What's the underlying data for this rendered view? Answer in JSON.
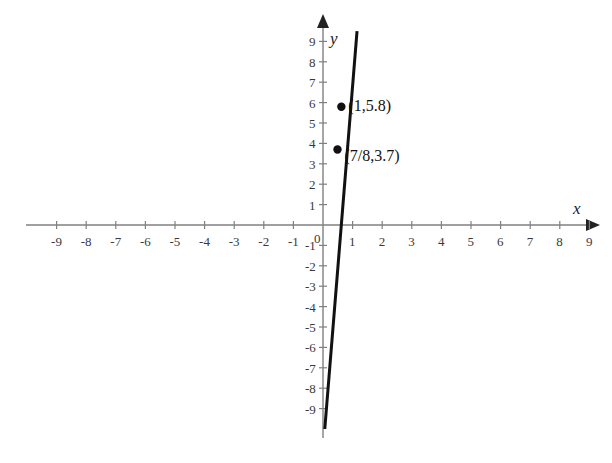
{
  "chart_data": {
    "type": "line",
    "title": "",
    "xlabel": "x",
    "ylabel": "y",
    "xlim": [
      -9.8,
      9.8
    ],
    "ylim": [
      -10.1,
      9.9
    ],
    "grid": false,
    "legend": null,
    "x_ticks": [
      -9,
      -8,
      -7,
      -6,
      -5,
      -4,
      -3,
      -2,
      -1,
      0,
      1,
      2,
      3,
      4,
      5,
      6,
      7,
      8,
      9
    ],
    "y_ticks": [
      -9,
      -8,
      -7,
      -6,
      -5,
      -4,
      -3,
      -2,
      -1,
      1,
      2,
      3,
      4,
      5,
      6,
      7,
      8,
      9
    ],
    "x_tick_labels": [
      "-9",
      "-8",
      "-7",
      "-6",
      "-5",
      "-4",
      "-3",
      "-2",
      "-1",
      "0",
      "1",
      "2",
      "3",
      "4",
      "5",
      "6",
      "7",
      "8",
      "9"
    ],
    "y_tick_labels": [
      "-9",
      "-8",
      "-7",
      "-6",
      "-5",
      "-4",
      "-3",
      "-2",
      "-1",
      "1",
      "2",
      "3",
      "4",
      "5",
      "6",
      "7",
      "8",
      "9"
    ],
    "origin_label": "0",
    "series": [
      {
        "name": "line",
        "type": "line",
        "slope": 16.8,
        "intercept": -11.0,
        "x_intercept": 0.655,
        "endpoints": [
          {
            "x": 1.15,
            "y": 9.5
          },
          {
            "x": 0.06,
            "y": -10.0
          }
        ],
        "color": "#111111",
        "width": 3
      }
    ],
    "points": [
      {
        "x": 1,
        "y": 5.8,
        "label": "(1,5.8)",
        "plot_x": 0.62,
        "plot_y": 5.8
      },
      {
        "x": 0.875,
        "y": 3.7,
        "label": "(7/8,3.7)",
        "plot_x": 0.49,
        "plot_y": 3.7
      }
    ],
    "annotations": [
      {
        "text": "(1,5.8)",
        "anchor_x": 0.62,
        "anchor_y": 5.8
      },
      {
        "text": "(7/8,3.7)",
        "anchor_x": 0.49,
        "anchor_y": 3.35
      }
    ],
    "axis_color": "#808080",
    "tick_color": "#808080",
    "label_color": "#3a3a3a",
    "background": "#ffffff"
  },
  "axes": {
    "x_name": "x",
    "y_name": "y"
  }
}
